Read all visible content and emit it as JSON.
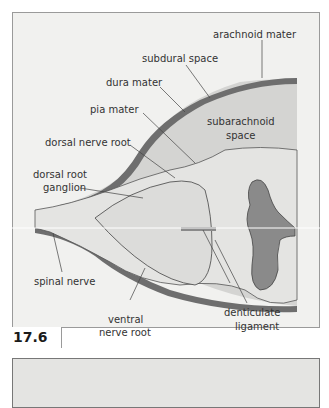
{
  "figure": {
    "number": "17.6",
    "labels": {
      "arachnoid_mater": "arachnoid mater",
      "subdural_space": "subdural space",
      "dura_mater": "dura mater",
      "pia_mater": "pia mater",
      "subarachnoid_space_1": "subarachnoid",
      "subarachnoid_space_2": "space",
      "dorsal_nerve_root": "dorsal nerve root",
      "dorsal_root_ganglion_1": "dorsal root",
      "dorsal_root_ganglion_2": "ganglion",
      "spinal_nerve": "spinal nerve",
      "ventral_nerve_root_1": "ventral",
      "ventral_nerve_root_2": "nerve root",
      "denticulate_ligament_1": "denticulate",
      "denticulate_ligament_2": "ligament"
    },
    "colors": {
      "background": "#f1f1ef",
      "dura": "#6e6e6e",
      "subarachnoid": "#d4d4d2",
      "grey_matter": "#8a8a8a",
      "nerve": "#e8e8e6"
    }
  }
}
